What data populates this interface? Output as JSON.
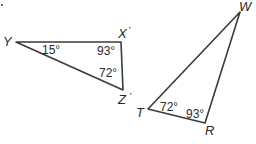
{
  "diagram": {
    "type": "geometry-similar-triangles",
    "stroke_color": "#3a3a3a",
    "text_color": "#2a2a2a",
    "triangles": [
      {
        "name": "XYZ",
        "vertices": {
          "Y": {
            "label": "Y"
          },
          "X": {
            "label": "X"
          },
          "Z": {
            "label": "Z"
          }
        },
        "angles": {
          "Y": "15°",
          "X": "93°",
          "Z": "72°"
        }
      },
      {
        "name": "WRT",
        "vertices": {
          "W": {
            "label": "W"
          },
          "T": {
            "label": "T"
          },
          "R": {
            "label": "R"
          }
        },
        "angles": {
          "T": "72°",
          "R": "93°"
        }
      }
    ]
  }
}
